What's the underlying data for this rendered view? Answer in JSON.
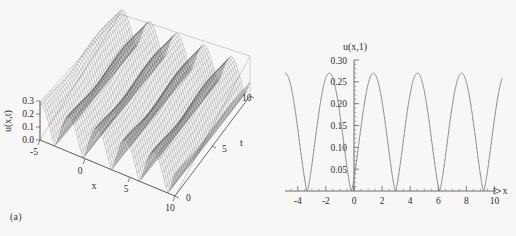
{
  "figure": {
    "background": "#f8f7f5",
    "ink": "#2b2b2b",
    "curve_color": "#7a7a7a",
    "mesh_color": "#3a3a3a"
  },
  "panel_a": {
    "caption": "(a)",
    "chart_data": {
      "type": "line",
      "render": "surface3d",
      "title": "",
      "xlabel": "x",
      "ylabel": "t",
      "zlabel": "u(x,t)",
      "xlim": [
        -5,
        10
      ],
      "ylim": [
        0,
        10
      ],
      "zlim": [
        0.0,
        0.3
      ],
      "xticks": [
        -5,
        0,
        5,
        10
      ],
      "xticklabels": [
        "-5",
        "0",
        "5",
        "10"
      ],
      "yticks": [
        0,
        5,
        10
      ],
      "yticklabels": [
        "0",
        "5",
        "10"
      ],
      "zticks": [
        0.0,
        0.1,
        0.2,
        0.3
      ],
      "zticklabels": [
        "0.0",
        "0.1",
        "0.2",
        "0.3"
      ],
      "grid": false,
      "legend": "none",
      "description": "Dense wireframe surface of a periodic soliton-like travelling wave; amplitude peaks near 0.27-0.30, spatial period about pi, ridges nearly stationary in t.",
      "amplitude_peak": 0.3,
      "spatial_period": 3.14,
      "ridge_count": 8
    }
  },
  "panel_b": {
    "caption": "(b)",
    "chart_data": {
      "type": "line",
      "title": "u(x,1)",
      "xlabel": "x",
      "ylabel": "",
      "xlim": [
        -5,
        10.6
      ],
      "ylim": [
        0.0,
        0.305
      ],
      "xticks": [
        -4,
        -2,
        0,
        2,
        4,
        6,
        8,
        10
      ],
      "xticklabels": [
        "-4",
        "-2",
        "0",
        "2",
        "4",
        "6",
        "8",
        "10"
      ],
      "yticks": [
        0.05,
        0.1,
        0.15,
        0.2,
        0.25,
        0.3
      ],
      "yticklabels": [
        "0.05",
        "0.10",
        "0.15",
        "0.20",
        "0.25",
        "0.30"
      ],
      "grid": false,
      "legend": "none",
      "peak_value": 0.27,
      "period": 3.14,
      "zeros": [
        -3.33,
        -0.19,
        2.99,
        6.15,
        9.3
      ],
      "peaks_x": [
        -1.76,
        1.4,
        4.57,
        7.72
      ],
      "description": "Periodic non-negative oscillation, squared-cosine-like cusped troughs touching zero, maxima about 0.27."
    }
  }
}
